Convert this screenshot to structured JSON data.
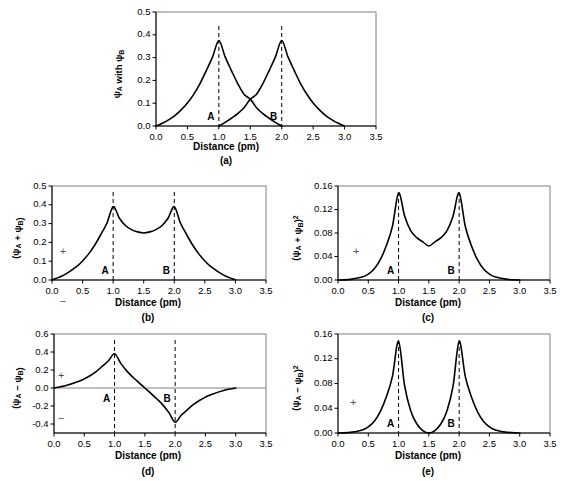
{
  "figure": {
    "xlabel": "Distance (pm)",
    "xticks": [
      "0.0",
      "0.5",
      "1.0",
      "1.5",
      "2.0",
      "2.5",
      "3.0",
      "3.5"
    ],
    "xtick_values": [
      0.0,
      0.5,
      1.0,
      1.5,
      2.0,
      2.5,
      3.0,
      3.5
    ],
    "xlim": [
      0.0,
      3.5
    ],
    "nucleus_a_label": "A",
    "nucleus_b_label": "B",
    "nucleus_a_x": 1.0,
    "nucleus_b_x": 2.0,
    "plus_sign": "+",
    "minus_sign": "−"
  },
  "panels": [
    {
      "id": "a",
      "caption": "(a)",
      "ylabel": "ψA with ψB",
      "ylabel_base": "ψ",
      "ylabel_sub1": "A",
      "ylabel_mid": " with ψ",
      "ylabel_sub2": "B",
      "ylabel_sup": "",
      "yticks": [
        "0.0",
        "0.1",
        "0.2",
        "0.3",
        "0.4",
        "0.5"
      ],
      "ytick_values": [
        0.0,
        0.1,
        0.2,
        0.3,
        0.4,
        0.5
      ],
      "ylim": [
        0.0,
        0.5
      ],
      "peak_a": 0.375,
      "peak_b": 0.375,
      "crossing_value": 0.118,
      "signs": []
    },
    {
      "id": "b",
      "caption": "(b)",
      "ylabel": "(ψA + ψB)",
      "ylabel_base": "(ψ",
      "ylabel_sub1": "A",
      "ylabel_mid": " + ψ",
      "ylabel_sub2": "B",
      "ylabel_sup": ")",
      "yticks": [
        "0.0",
        "0.1",
        "0.2",
        "0.3",
        "0.4",
        "0.5"
      ],
      "ytick_values": [
        0.0,
        0.1,
        0.2,
        0.3,
        0.4,
        0.5
      ],
      "ylim": [
        0.0,
        0.5
      ],
      "peak_a": 0.39,
      "peak_b": 0.39,
      "midpoint_value": 0.25,
      "signs": [
        "+",
        "−"
      ]
    },
    {
      "id": "c",
      "caption": "(c)",
      "ylabel": "(ψA + ψB)²",
      "ylabel_base": "(ψ",
      "ylabel_sub1": "A",
      "ylabel_mid": " + ψ",
      "ylabel_sub2": "B",
      "ylabel_sup": ")²",
      "yticks": [
        "0.00",
        "0.04",
        "0.08",
        "0.12",
        "0.16"
      ],
      "ytick_values": [
        0.0,
        0.04,
        0.08,
        0.12,
        0.16
      ],
      "ylim": [
        0.0,
        0.16
      ],
      "peak_a": 0.148,
      "peak_b": 0.148,
      "midpoint_value": 0.058,
      "signs": [
        "+"
      ]
    },
    {
      "id": "d",
      "caption": "(d)",
      "ylabel": "(ψA − ψB)",
      "ylabel_base": "(ψ",
      "ylabel_sub1": "A",
      "ylabel_mid": " − ψ",
      "ylabel_sub2": "B",
      "ylabel_sup": ")",
      "yticks": [
        "-0.4",
        "-0.2",
        "0.0",
        "0.2",
        "0.4",
        "0.6"
      ],
      "ytick_values": [
        -0.4,
        -0.2,
        0.0,
        0.2,
        0.4,
        0.6
      ],
      "ylim": [
        -0.5,
        0.6
      ],
      "peak_a": 0.38,
      "peak_b": -0.38,
      "node_x": 1.5,
      "signs": [
        "+",
        "−"
      ]
    },
    {
      "id": "e",
      "caption": "(e)",
      "ylabel": "(ψA − ψB)²",
      "ylabel_base": "(ψ",
      "ylabel_sub1": "A",
      "ylabel_mid": " − ψ",
      "ylabel_sub2": "B",
      "ylabel_sup": ")²",
      "yticks": [
        "0.00",
        "0.04",
        "0.08",
        "0.12",
        "0.16"
      ],
      "ytick_values": [
        0.0,
        0.04,
        0.08,
        0.12,
        0.16
      ],
      "ylim": [
        0.0,
        0.16
      ],
      "peak_a": 0.148,
      "peak_b": 0.148,
      "node_x": 1.5,
      "signs": [
        "+"
      ]
    }
  ],
  "chart_data": {
    "type": "line",
    "title": "",
    "xlabel": "Distance (pm)",
    "xlim": [
      0.0,
      3.5
    ],
    "grid": false,
    "legend": "none",
    "subplots": [
      {
        "panel": "a",
        "ylabel": "ψA with ψB",
        "ylim": [
          0.0,
          0.5
        ],
        "yticks": [
          0.0,
          0.1,
          0.2,
          0.3,
          0.4,
          0.5
        ],
        "series": [
          {
            "name": "ψA",
            "x": [
              0.0,
              0.1,
              0.2,
              0.3,
              0.4,
              0.5,
              0.6,
              0.7,
              0.8,
              0.9,
              1.0,
              1.1,
              1.2,
              1.3,
              1.4,
              1.5,
              1.6,
              1.7,
              1.8,
              1.9,
              2.0
            ],
            "values": [
              0.0,
              0.012,
              0.027,
              0.046,
              0.071,
              0.101,
              0.139,
              0.186,
              0.243,
              0.303,
              0.375,
              0.303,
              0.243,
              0.186,
              0.139,
              0.118,
              0.08,
              0.054,
              0.034,
              0.016,
              0.0
            ]
          },
          {
            "name": "ψB",
            "x": [
              1.0,
              1.1,
              1.2,
              1.3,
              1.4,
              1.5,
              1.6,
              1.7,
              1.8,
              1.9,
              2.0,
              2.1,
              2.2,
              2.3,
              2.4,
              2.5,
              2.6,
              2.7,
              2.8,
              2.9,
              3.0
            ],
            "values": [
              0.0,
              0.016,
              0.034,
              0.054,
              0.08,
              0.118,
              0.139,
              0.186,
              0.243,
              0.303,
              0.375,
              0.303,
              0.243,
              0.186,
              0.139,
              0.101,
              0.071,
              0.046,
              0.027,
              0.012,
              0.0
            ]
          }
        ],
        "annotations": [
          {
            "label": "A",
            "x": 1.0
          },
          {
            "label": "B",
            "x": 2.0
          }
        ]
      },
      {
        "panel": "b",
        "ylabel": "(ψA + ψB)",
        "ylim": [
          0.0,
          0.5
        ],
        "yticks": [
          0.0,
          0.1,
          0.2,
          0.3,
          0.4,
          0.5
        ],
        "series": [
          {
            "name": "ψA + ψB",
            "x": [
              0.0,
              0.2,
              0.4,
              0.5,
              0.6,
              0.7,
              0.8,
              0.9,
              1.0,
              1.1,
              1.2,
              1.3,
              1.4,
              1.5,
              1.6,
              1.7,
              1.8,
              1.9,
              2.0,
              2.1,
              2.2,
              2.3,
              2.4,
              2.5,
              2.6,
              2.8,
              3.0
            ],
            "values": [
              0.0,
              0.027,
              0.071,
              0.101,
              0.139,
              0.186,
              0.243,
              0.303,
              0.39,
              0.33,
              0.29,
              0.268,
              0.256,
              0.25,
              0.256,
              0.268,
              0.29,
              0.33,
              0.39,
              0.303,
              0.243,
              0.186,
              0.139,
              0.101,
              0.071,
              0.027,
              0.0
            ]
          }
        ],
        "annotations": [
          {
            "label": "A",
            "x": 1.0
          },
          {
            "label": "B",
            "x": 2.0
          },
          {
            "label": "+",
            "x": 0.18
          },
          {
            "label": "−",
            "x": 0.18
          }
        ]
      },
      {
        "panel": "c",
        "ylabel": "(ψA + ψB)²",
        "ylim": [
          0.0,
          0.16
        ],
        "yticks": [
          0.0,
          0.04,
          0.08,
          0.12,
          0.16
        ],
        "series": [
          {
            "name": "(ψA + ψB)²",
            "x": [
              0.0,
              0.2,
              0.4,
              0.5,
              0.6,
              0.7,
              0.8,
              0.9,
              1.0,
              1.1,
              1.2,
              1.3,
              1.4,
              1.5,
              1.6,
              1.7,
              1.8,
              1.9,
              2.0,
              2.1,
              2.2,
              2.3,
              2.4,
              2.5,
              2.6,
              2.8,
              3.0
            ],
            "values": [
              0.0,
              0.001,
              0.005,
              0.01,
              0.019,
              0.035,
              0.059,
              0.092,
              0.148,
              0.109,
              0.084,
              0.072,
              0.065,
              0.058,
              0.065,
              0.072,
              0.084,
              0.109,
              0.148,
              0.092,
              0.059,
              0.035,
              0.019,
              0.01,
              0.005,
              0.001,
              0.0
            ]
          }
        ],
        "annotations": [
          {
            "label": "A",
            "x": 1.0
          },
          {
            "label": "B",
            "x": 2.0
          },
          {
            "label": "+",
            "x": 0.3
          }
        ]
      },
      {
        "panel": "d",
        "ylabel": "(ψA − ψB)",
        "ylim": [
          -0.5,
          0.6
        ],
        "yticks": [
          -0.4,
          -0.2,
          0.0,
          0.2,
          0.4,
          0.6
        ],
        "series": [
          {
            "name": "ψA − ψB",
            "x": [
              0.0,
              0.2,
              0.4,
              0.5,
              0.6,
              0.7,
              0.8,
              0.9,
              1.0,
              1.1,
              1.2,
              1.3,
              1.4,
              1.5,
              1.6,
              1.7,
              1.8,
              1.9,
              2.0,
              2.1,
              2.2,
              2.3,
              2.4,
              2.5,
              2.6,
              2.8,
              3.0
            ],
            "values": [
              0.0,
              0.027,
              0.071,
              0.101,
              0.139,
              0.186,
              0.243,
              0.303,
              0.38,
              0.276,
              0.19,
              0.122,
              0.06,
              0.0,
              -0.06,
              -0.122,
              -0.19,
              -0.276,
              -0.38,
              -0.303,
              -0.243,
              -0.186,
              -0.139,
              -0.101,
              -0.071,
              -0.027,
              0.0
            ]
          }
        ],
        "annotations": [
          {
            "label": "A",
            "x": 1.0
          },
          {
            "label": "B",
            "x": 2.0
          },
          {
            "label": "+",
            "x": 0.12
          },
          {
            "label": "−",
            "x": 0.12
          }
        ]
      },
      {
        "panel": "e",
        "ylabel": "(ψA − ψB)²",
        "ylim": [
          0.0,
          0.16
        ],
        "yticks": [
          0.0,
          0.04,
          0.08,
          0.12,
          0.16
        ],
        "series": [
          {
            "name": "(ψA − ψB)²",
            "x": [
              0.0,
              0.2,
              0.4,
              0.5,
              0.6,
              0.7,
              0.8,
              0.9,
              1.0,
              1.1,
              1.2,
              1.3,
              1.4,
              1.5,
              1.6,
              1.7,
              1.8,
              1.9,
              2.0,
              2.1,
              2.2,
              2.3,
              2.4,
              2.5,
              2.6,
              2.8,
              3.0
            ],
            "values": [
              0.0,
              0.001,
              0.005,
              0.01,
              0.019,
              0.035,
              0.059,
              0.092,
              0.148,
              0.076,
              0.036,
              0.015,
              0.004,
              0.0,
              0.004,
              0.015,
              0.036,
              0.076,
              0.148,
              0.092,
              0.059,
              0.035,
              0.019,
              0.01,
              0.005,
              0.001,
              0.0
            ]
          }
        ],
        "annotations": [
          {
            "label": "A",
            "x": 1.0
          },
          {
            "label": "B",
            "x": 2.0
          },
          {
            "label": "+",
            "x": 0.25
          }
        ]
      }
    ]
  }
}
